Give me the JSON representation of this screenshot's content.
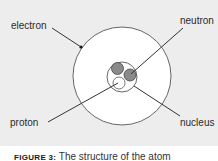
{
  "diagram": {
    "title": "The structure of the atom",
    "labels": {
      "electron": "electron",
      "neutron": "neutron",
      "proton": "proton",
      "nucleus": "nucleus"
    },
    "colors": {
      "background": "#ededed",
      "outline": "#555555",
      "neutron_fill": "#8a8a8a",
      "proton_fill": "#ffffff",
      "leader_line": "#333333"
    }
  },
  "caption": {
    "figure_label": "FIGURE 3:",
    "text": " The structure of the atom"
  }
}
